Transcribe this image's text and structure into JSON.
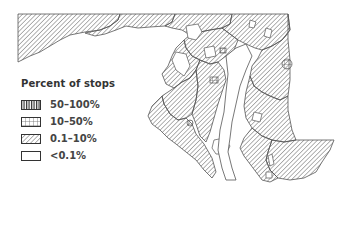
{
  "map": {
    "region": "Maryland",
    "type": "choropleth",
    "stroke_color": "#555555",
    "hatch_color": "#666666",
    "background": "#ffffff"
  },
  "legend": {
    "title": "Percent of stops",
    "items": [
      {
        "label": "50–100%",
        "pattern": "vertical-lines"
      },
      {
        "label": "10–50%",
        "pattern": "grid"
      },
      {
        "label": "0.1–10%",
        "pattern": "diagonal-lines"
      },
      {
        "label": "<0.1%",
        "pattern": "empty"
      }
    ]
  }
}
